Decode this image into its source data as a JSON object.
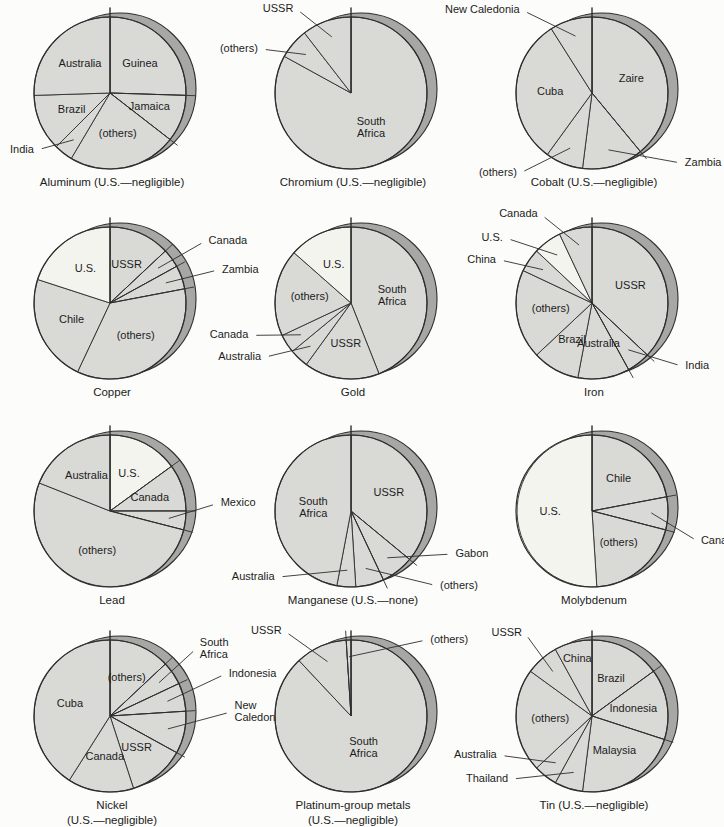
{
  "page": {
    "background": "#fcfcfa"
  },
  "palette": {
    "slice_fill": "#d9d9d6",
    "us_fill": "#f4f4ef",
    "rim_fill": "#a7a7a4",
    "outline": "#2e2e2e",
    "label_color": "#1c1c1c"
  },
  "chart_data": [
    {
      "type": "pie",
      "title": "Aluminum (U.S.—negligible)",
      "slices": [
        {
          "label": "Guinea",
          "value": 25.5
        },
        {
          "label": "Jamaica",
          "value": 10
        },
        {
          "label": "(others)",
          "value": 23
        },
        {
          "label": "India",
          "value": 4,
          "outside": true,
          "la": 232,
          "lr": 1.22
        },
        {
          "label": "Brazil",
          "value": 12
        },
        {
          "label": "Australia",
          "value": 25.5
        }
      ]
    },
    {
      "type": "pie",
      "title": "Chromium (U.S.—negligible)",
      "slices": [
        {
          "label": "South Africa",
          "value": 83,
          "wrap": true,
          "ir": 0.52
        },
        {
          "label": "(others)",
          "value": 6.5,
          "outside": true,
          "la": 296,
          "lr": 1.32
        },
        {
          "label": "USSR",
          "value": 10.5,
          "outside": true,
          "la": 327,
          "lr": 1.32
        }
      ]
    },
    {
      "type": "pie",
      "title": "Cobalt (U.S.—negligible)",
      "slices": [
        {
          "label": "Zaire",
          "value": 39
        },
        {
          "label": "Zambia",
          "value": 13,
          "outside": true,
          "la": 128,
          "lr": 1.5
        },
        {
          "label": "(others)",
          "value": 8,
          "outside": true,
          "la": 222,
          "lr": 1.42
        },
        {
          "label": "Cuba",
          "value": 31
        },
        {
          "label": "New Caledonia",
          "value": 9,
          "outside": true,
          "la": 320,
          "lr": 1.42
        }
      ]
    },
    {
      "type": "pie",
      "title": "Copper",
      "slices": [
        {
          "label": "USSR",
          "value": 13
        },
        {
          "label": "Canada",
          "value": 4,
          "outside": true,
          "la": 57,
          "lr": 1.5
        },
        {
          "label": "Zambia",
          "value": 5,
          "outside": true,
          "la": 73,
          "lr": 1.5
        },
        {
          "label": "(others)",
          "value": 35
        },
        {
          "label": "Chile",
          "value": 23
        },
        {
          "label": "U.S.",
          "value": 20,
          "light": true
        }
      ]
    },
    {
      "type": "pie",
      "title": "Gold",
      "slices": [
        {
          "label": "South Africa",
          "value": 44,
          "wrap": true
        },
        {
          "label": "USSR",
          "value": 16
        },
        {
          "label": "Australia",
          "value": 4,
          "outside": true,
          "la": 238,
          "lr": 1.35
        },
        {
          "label": "Canada",
          "value": 4,
          "outside": true,
          "la": 252,
          "lr": 1.38
        },
        {
          "label": "(others)",
          "value": 18.5
        },
        {
          "label": "U.S.",
          "value": 13.5,
          "light": true
        }
      ]
    },
    {
      "type": "pie",
      "title": "Iron",
      "slices": [
        {
          "label": "USSR",
          "value": 37
        },
        {
          "label": "India",
          "value": 5,
          "outside": true,
          "la": 125,
          "lr": 1.45
        },
        {
          "label": "Australia",
          "value": 11
        },
        {
          "label": "Brazil",
          "value": 10
        },
        {
          "label": "(others)",
          "value": 19
        },
        {
          "label": "China",
          "value": 5,
          "outside": true,
          "la": 295,
          "lr": 1.35
        },
        {
          "label": "U.S.",
          "value": 6,
          "light": true,
          "outside": true,
          "la": 307,
          "lr": 1.42
        },
        {
          "label": "Canada",
          "value": 7,
          "outside": true,
          "la": 330,
          "lr": 1.35
        }
      ]
    },
    {
      "type": "pie",
      "title": "Lead",
      "slices": [
        {
          "label": "U.S.",
          "value": 15,
          "light": true
        },
        {
          "label": "Canada",
          "value": 10
        },
        {
          "label": "Mexico",
          "value": 4,
          "outside": true,
          "la": 86,
          "lr": 1.42
        },
        {
          "label": "(others)",
          "value": 52
        },
        {
          "label": "Australia",
          "value": 19
        }
      ]
    },
    {
      "type": "pie",
      "title": "Manganese (U.S.—none)",
      "slices": [
        {
          "label": "USSR",
          "value": 36
        },
        {
          "label": "Gabon",
          "value": 7,
          "outside": true,
          "la": 113,
          "lr": 1.45
        },
        {
          "label": "(others)",
          "value": 6,
          "outside": true,
          "la": 131,
          "lr": 1.5
        },
        {
          "label": "Australia",
          "value": 4,
          "outside": true,
          "la": 228,
          "lr": 1.3
        },
        {
          "label": "South Africa",
          "value": 47,
          "wrap": true,
          "ir": 0.5
        }
      ]
    },
    {
      "type": "pie",
      "title": "Molybdenum",
      "slices": [
        {
          "label": "Chile",
          "value": 22
        },
        {
          "label": "Canada",
          "value": 7,
          "outside": true,
          "la": 106,
          "lr": 1.45
        },
        {
          "label": "(others)",
          "value": 20
        },
        {
          "label": "U.S.",
          "value": 51,
          "light": true
        }
      ]
    },
    {
      "type": "pie",
      "title": "Nickel\n(U.S.—negligible)",
      "slices": [
        {
          "label": "(others)",
          "value": 13
        },
        {
          "label": "South Africa",
          "value": 5,
          "outside": true,
          "wrap": true,
          "la": 52,
          "lr": 1.45
        },
        {
          "label": "Indonesia",
          "value": 6,
          "outside": true,
          "la": 70,
          "lr": 1.62
        },
        {
          "label": "New Caledonia",
          "value": 9,
          "outside": true,
          "wrap": true,
          "la": 88,
          "lr": 1.6
        },
        {
          "label": "USSR",
          "value": 12
        },
        {
          "label": "Canada",
          "value": 14
        },
        {
          "label": "Cuba",
          "value": 41
        }
      ]
    },
    {
      "type": "pie",
      "title": "Platinum-group metals\n(U.S.—negligible)",
      "slices": [
        {
          "label": "South Africa",
          "value": 88,
          "wrap": true,
          "ir": 0.45
        },
        {
          "label": "USSR",
          "value": 11,
          "outside": true,
          "la": 322,
          "lr": 1.42
        },
        {
          "label": "(others)",
          "value": 1,
          "outside": true,
          "la": 45,
          "lr": 1.42
        }
      ]
    },
    {
      "type": "pie",
      "title": "Tin (U.S.—negligible)",
      "slices": [
        {
          "label": "Brazil",
          "value": 15
        },
        {
          "label": "Indonesia",
          "value": 15
        },
        {
          "label": "Malaysia",
          "value": 22
        },
        {
          "label": "Thailand",
          "value": 6,
          "outside": true,
          "la": 232,
          "lr": 1.35
        },
        {
          "label": "Australia",
          "value": 5,
          "outside": true,
          "la": 247,
          "lr": 1.32
        },
        {
          "label": "(others)",
          "value": 22
        },
        {
          "label": "USSR",
          "value": 7,
          "outside": true,
          "la": 321,
          "lr": 1.4
        },
        {
          "label": "China",
          "value": 8,
          "ir": 0.78
        }
      ]
    }
  ]
}
